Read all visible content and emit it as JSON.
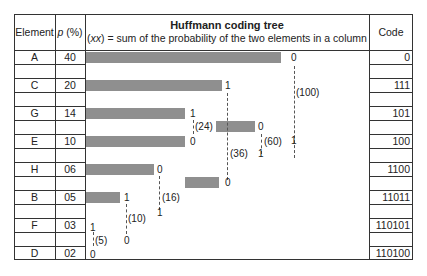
{
  "header": {
    "element": "Element",
    "p_symbol": "p",
    "p_unit": " (%)",
    "tree_title": "Huffmann coding tree",
    "tree_sub_italic": "xx",
    "tree_sub_rest": " = sum of the probability of the two elements in a column",
    "tree_sub_open": "(",
    "tree_sub_close": ")",
    "code": "Code"
  },
  "rows": [
    {
      "element": "A",
      "p": "40",
      "code": "0"
    },
    {
      "element": "C",
      "p": "20",
      "code": "111"
    },
    {
      "element": "G",
      "p": "14",
      "code": "101"
    },
    {
      "element": "E",
      "p": "10",
      "code": "100"
    },
    {
      "element": "H",
      "p": "06",
      "code": "1100"
    },
    {
      "element": "B",
      "p": "05",
      "code": "11011"
    },
    {
      "element": "F",
      "p": "03",
      "code": "110101"
    },
    {
      "element": "D",
      "p": "02",
      "code": "110100"
    }
  ],
  "tree": {
    "labels": {
      "a_bit": "0",
      "c_bit": "1",
      "g_bit": "1",
      "e_bit": "0",
      "h_bit": "0",
      "b_bit": "1",
      "f_bit": "1",
      "d_bit": "0",
      "n24_bit": "0",
      "n16_bit": "0",
      "n10_bit": "1",
      "n5_bit": "0",
      "n36_bit": "1",
      "n60_bit": "1",
      "sum_100": "(100)",
      "sum_60": "(60)",
      "sum_36": "(36)",
      "sum_24": "(24)",
      "sum_16": "(16)",
      "sum_10": "(10)",
      "sum_5": "(5)"
    },
    "bar_color": "#8f8f8f"
  }
}
